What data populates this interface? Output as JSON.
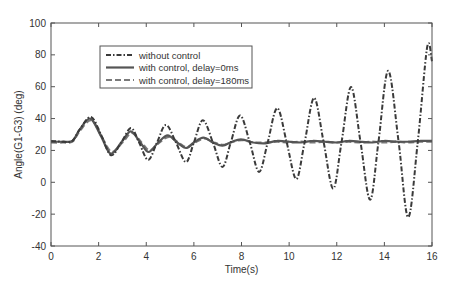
{
  "chart_data": {
    "type": "line",
    "title": "",
    "xlabel": "Time(s)",
    "ylabel": "Angle(G1-G3) (deg)",
    "xlim": [
      0,
      16
    ],
    "ylim": [
      -40,
      100
    ],
    "xticks": [
      0,
      2,
      4,
      6,
      8,
      10,
      12,
      14,
      16
    ],
    "yticks": [
      -40,
      -20,
      0,
      20,
      40,
      60,
      80,
      100
    ],
    "grid": false,
    "legend_position": "upper-left-inside",
    "series": [
      {
        "name": "without control",
        "style": "dashdot",
        "color": "#3a3a3a",
        "points": [
          [
            0,
            26
          ],
          [
            0.5,
            25.5
          ],
          [
            0.9,
            26
          ],
          [
            1.2,
            33
          ],
          [
            1.68,
            41
          ],
          [
            2.1,
            30
          ],
          [
            2.52,
            17
          ],
          [
            2.95,
            25
          ],
          [
            3.36,
            34
          ],
          [
            3.7,
            25
          ],
          [
            4.08,
            14
          ],
          [
            4.45,
            25
          ],
          [
            4.83,
            36
          ],
          [
            5.25,
            25
          ],
          [
            5.67,
            12.7
          ],
          [
            6.0,
            25
          ],
          [
            6.38,
            39
          ],
          [
            6.8,
            25
          ],
          [
            7.2,
            9.6
          ],
          [
            7.55,
            25
          ],
          [
            7.94,
            42
          ],
          [
            8.35,
            25
          ],
          [
            8.74,
            6.5
          ],
          [
            9.1,
            25
          ],
          [
            9.5,
            46.6
          ],
          [
            9.9,
            25
          ],
          [
            10.3,
            2
          ],
          [
            10.65,
            25
          ],
          [
            11.05,
            53
          ],
          [
            11.45,
            25
          ],
          [
            11.85,
            -4
          ],
          [
            12.2,
            25
          ],
          [
            12.6,
            59.8
          ],
          [
            13.0,
            25
          ],
          [
            13.4,
            -11
          ],
          [
            13.75,
            25
          ],
          [
            14.16,
            70
          ],
          [
            14.6,
            25
          ],
          [
            15.0,
            -22
          ],
          [
            15.4,
            25
          ],
          [
            15.8,
            85
          ],
          [
            16.0,
            76
          ]
        ]
      },
      {
        "name": "with control, delay=0ms",
        "style": "solid",
        "color": "#555555",
        "points": [
          [
            0,
            25.5
          ],
          [
            0.5,
            25.5
          ],
          [
            0.9,
            26
          ],
          [
            1.2,
            33
          ],
          [
            1.65,
            40
          ],
          [
            2.1,
            29
          ],
          [
            2.5,
            18
          ],
          [
            2.95,
            25
          ],
          [
            3.35,
            32
          ],
          [
            3.75,
            25
          ],
          [
            4.1,
            19
          ],
          [
            4.5,
            25
          ],
          [
            4.9,
            29.5
          ],
          [
            5.3,
            25
          ],
          [
            5.67,
            21.5
          ],
          [
            6.0,
            25
          ],
          [
            6.4,
            28
          ],
          [
            6.8,
            25
          ],
          [
            7.2,
            23
          ],
          [
            7.6,
            25.5
          ],
          [
            8.0,
            27
          ],
          [
            8.5,
            25
          ],
          [
            9.0,
            24.5
          ],
          [
            9.5,
            26
          ],
          [
            10.0,
            25.5
          ],
          [
            10.5,
            25
          ],
          [
            11.0,
            26
          ],
          [
            11.5,
            25.5
          ],
          [
            12.0,
            25
          ],
          [
            12.5,
            26
          ],
          [
            13.0,
            25.5
          ],
          [
            13.5,
            25
          ],
          [
            14.0,
            26
          ],
          [
            14.5,
            25.5
          ],
          [
            15.0,
            25.5
          ],
          [
            15.5,
            26
          ],
          [
            16.0,
            26
          ]
        ]
      },
      {
        "name": "with control, delay=180ms",
        "style": "dashed",
        "color": "#7a7a7a",
        "points": [
          [
            0,
            25
          ],
          [
            0.5,
            25
          ],
          [
            0.9,
            25.5
          ],
          [
            1.2,
            32
          ],
          [
            1.7,
            39
          ],
          [
            2.15,
            28
          ],
          [
            2.55,
            19
          ],
          [
            3.0,
            25
          ],
          [
            3.4,
            31
          ],
          [
            3.8,
            25
          ],
          [
            4.15,
            20
          ],
          [
            4.55,
            25
          ],
          [
            4.95,
            28.5
          ],
          [
            5.35,
            25
          ],
          [
            5.7,
            22
          ],
          [
            6.05,
            25
          ],
          [
            6.45,
            27.5
          ],
          [
            6.85,
            25
          ],
          [
            7.25,
            23.5
          ],
          [
            7.65,
            25.5
          ],
          [
            8.05,
            26.5
          ],
          [
            8.5,
            25
          ],
          [
            9.0,
            25
          ],
          [
            9.5,
            25.5
          ],
          [
            10.0,
            25
          ],
          [
            10.5,
            25.5
          ],
          [
            11.0,
            25
          ],
          [
            11.5,
            25.5
          ],
          [
            12.0,
            25
          ],
          [
            12.5,
            25.5
          ],
          [
            13.0,
            25
          ],
          [
            13.5,
            25.5
          ],
          [
            14.0,
            25
          ],
          [
            14.5,
            25.5
          ],
          [
            15.0,
            25
          ],
          [
            15.5,
            25.5
          ],
          [
            16.0,
            25.5
          ]
        ]
      }
    ]
  },
  "plot_area": {
    "left": 51,
    "top": 23,
    "right": 432,
    "bottom": 246
  },
  "legend_box": {
    "x": 100,
    "y": 46,
    "w": 152,
    "h": 42
  },
  "colors": {
    "axis": "#555555",
    "background": "#ffffff",
    "legend_border": "#555555"
  }
}
